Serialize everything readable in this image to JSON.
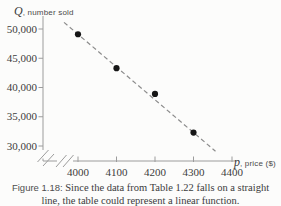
{
  "y_axis_title": {
    "variable": "Q",
    "descriptor": ", number sold"
  },
  "x_axis_title": {
    "variable": "p",
    "descriptor": ", price ($)"
  },
  "caption": {
    "prefix": "Figure 1.18:",
    "line1": " Since the data from Table 1.22 falls on a straight",
    "line2": "line, the table could represent a linear function."
  },
  "chart_data": {
    "type": "scatter",
    "title": "",
    "xlabel": "p, price ($)",
    "ylabel": "Q, number sold",
    "x": [
      4000,
      4100,
      4200,
      4300
    ],
    "y": [
      49100,
      43300,
      38900,
      32300
    ],
    "trend_line": {
      "style": "dashed",
      "fit": "linear-through-points"
    },
    "x_tick_values": [
      4000,
      4100,
      4200,
      4300,
      4400
    ],
    "x_tick_labels": [
      "4000",
      "4100",
      "4200",
      "4300",
      "4400"
    ],
    "y_tick_values": [
      50000,
      45000,
      40000,
      35000,
      30000
    ],
    "y_tick_labels": [
      "50,000",
      "45,000",
      "40,000",
      "35,000",
      "30,000"
    ],
    "xlim": [
      4000,
      4400
    ],
    "ylim": [
      30000,
      50000
    ],
    "axis_breaks": [
      "x-axis-near-origin",
      "y-axis-near-origin"
    ],
    "grid": false,
    "legend": false,
    "colors": {
      "point": "#161616",
      "trend_line": "#8c8c8c",
      "axis": "#9c9c9c",
      "tick_label": "#3c3c3c"
    }
  }
}
